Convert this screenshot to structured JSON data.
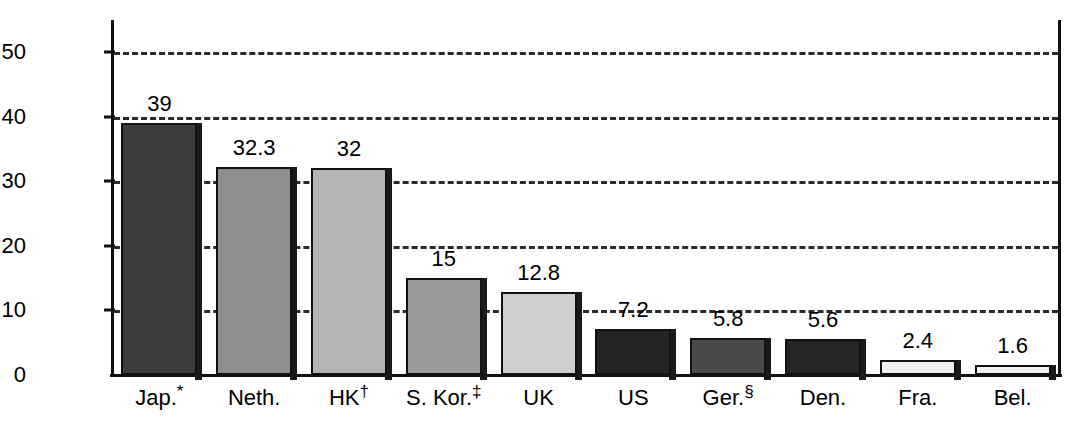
{
  "chart_data": {
    "type": "bar",
    "title": "",
    "xlabel": "",
    "ylabel": "Volume of sand extracted (10^6 m^3)",
    "ylabel_parts": {
      "text_before": "Volume of sand extracted (10",
      "sup_1": "6",
      "text_mid": " m",
      "sup_2": "3",
      "text_after": ")"
    },
    "categories": [
      "Jap.*",
      "Neth.",
      "HK†",
      "S. Kor.‡",
      "UK",
      "US",
      "Ger.§",
      "Den.",
      "Fra.",
      "Bel."
    ],
    "category_parts": [
      {
        "base": "Jap.",
        "marker": "*"
      },
      {
        "base": "Neth.",
        "marker": ""
      },
      {
        "base": "HK",
        "marker": "†"
      },
      {
        "base": "S. Kor.",
        "marker": "‡"
      },
      {
        "base": "UK",
        "marker": ""
      },
      {
        "base": "US",
        "marker": ""
      },
      {
        "base": "Ger.",
        "marker": "§"
      },
      {
        "base": "Den.",
        "marker": ""
      },
      {
        "base": "Fra.",
        "marker": ""
      },
      {
        "base": "Bel.",
        "marker": ""
      }
    ],
    "values": [
      39,
      32.3,
      32,
      15,
      12.8,
      7.2,
      5.8,
      5.6,
      2.4,
      1.6
    ],
    "value_labels": [
      "39",
      "32.3",
      "32",
      "15",
      "12.8",
      "7.2",
      "5.8",
      "5.6",
      "2.4",
      "1.6"
    ],
    "bar_colors": [
      "#3c3c3c",
      "#8e8e8e",
      "#b4b4b4",
      "#9a9a9a",
      "#cfcfcf",
      "#232323",
      "#4a4a4a",
      "#252525",
      "#efefef",
      "#f2f2f2"
    ],
    "ylim": [
      0,
      55
    ],
    "yticks": [
      0,
      10,
      20,
      30,
      40,
      50
    ],
    "ytick_labels": [
      "0",
      "10",
      "20",
      "30",
      "40",
      "50"
    ],
    "gridlines": [
      10,
      20,
      30,
      40,
      50
    ],
    "grid": true,
    "grid_style": "dashed",
    "grid_color": "#2b2b2b",
    "legend": null,
    "axis_color": "#111111",
    "background": "#ffffff"
  }
}
